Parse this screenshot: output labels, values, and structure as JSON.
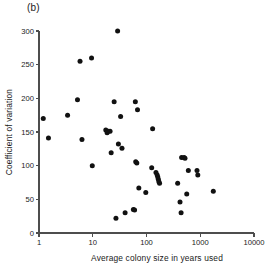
{
  "figure": {
    "panel_label": "(b)",
    "background": "#ffffff",
    "point_color": "#111111",
    "axis_color": "#4d4d4d"
  },
  "chart_data": {
    "type": "scatter",
    "title": "(b)",
    "xlabel": "Average colony size in years used",
    "ylabel": "Coefficient of variation",
    "xscale": "log",
    "yscale": "linear",
    "xlim": [
      1,
      10000
    ],
    "ylim": [
      0,
      300
    ],
    "grid": false,
    "legend": null,
    "xticks": [
      1,
      10,
      100,
      1000,
      10000
    ],
    "xticklabels": [
      "1",
      "10",
      "100",
      "1000",
      "10000"
    ],
    "yticks": [
      0,
      50,
      100,
      150,
      200,
      250,
      300
    ],
    "yticklabels": [
      "0",
      "50",
      "100",
      "150",
      "200",
      "250",
      "300"
    ],
    "series": [
      {
        "name": "colonies",
        "marker": "filled-circle",
        "points": [
          {
            "x": 1.2,
            "y": 170
          },
          {
            "x": 1.5,
            "y": 141
          },
          {
            "x": 3.4,
            "y": 175
          },
          {
            "x": 5.2,
            "y": 198
          },
          {
            "x": 5.8,
            "y": 255
          },
          {
            "x": 6.3,
            "y": 139
          },
          {
            "x": 9.5,
            "y": 260
          },
          {
            "x": 9.8,
            "y": 100
          },
          {
            "x": 17.5,
            "y": 153
          },
          {
            "x": 18.5,
            "y": 149
          },
          {
            "x": 19.5,
            "y": 151
          },
          {
            "x": 21.0,
            "y": 151
          },
          {
            "x": 22.0,
            "y": 119
          },
          {
            "x": 25.0,
            "y": 195
          },
          {
            "x": 27.0,
            "y": 22
          },
          {
            "x": 29.0,
            "y": 300
          },
          {
            "x": 30.0,
            "y": 132
          },
          {
            "x": 33.0,
            "y": 173
          },
          {
            "x": 35.0,
            "y": 126
          },
          {
            "x": 40.0,
            "y": 30
          },
          {
            "x": 57.0,
            "y": 35
          },
          {
            "x": 60.0,
            "y": 34
          },
          {
            "x": 62.0,
            "y": 195
          },
          {
            "x": 63.0,
            "y": 106
          },
          {
            "x": 66.0,
            "y": 104
          },
          {
            "x": 68.0,
            "y": 183
          },
          {
            "x": 72.0,
            "y": 67
          },
          {
            "x": 97.0,
            "y": 60
          },
          {
            "x": 125.0,
            "y": 97
          },
          {
            "x": 130.0,
            "y": 155
          },
          {
            "x": 150.0,
            "y": 90
          },
          {
            "x": 158.0,
            "y": 86
          },
          {
            "x": 162.0,
            "y": 83
          },
          {
            "x": 166.0,
            "y": 80
          },
          {
            "x": 170.0,
            "y": 76
          },
          {
            "x": 175.0,
            "y": 74
          },
          {
            "x": 380.0,
            "y": 74
          },
          {
            "x": 420.0,
            "y": 46
          },
          {
            "x": 440.0,
            "y": 30
          },
          {
            "x": 450.0,
            "y": 112
          },
          {
            "x": 500.0,
            "y": 112
          },
          {
            "x": 520.0,
            "y": 111
          },
          {
            "x": 560.0,
            "y": 58
          },
          {
            "x": 600.0,
            "y": 93
          },
          {
            "x": 870.0,
            "y": 93
          },
          {
            "x": 900.0,
            "y": 86
          },
          {
            "x": 1750.0,
            "y": 62
          }
        ]
      }
    ]
  }
}
